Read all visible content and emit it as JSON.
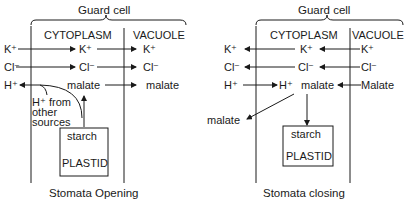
{
  "panels": [
    {
      "caption": "Stomata Opening",
      "header": "Guard cell",
      "col_cytoplasm": "CYTOPLASM",
      "col_vacuole": "VACUOLE",
      "ions_out": [
        "K⁺",
        "Cl⁻",
        "H⁺"
      ],
      "ions_cyto": [
        "K⁺",
        "Cl⁻",
        "malate"
      ],
      "ions_vac": [
        "K⁺",
        "Cl⁻",
        "malate"
      ],
      "hplus_note": [
        "H⁺ from",
        "other",
        "sources"
      ],
      "plastid_top": "starch",
      "plastid_label": "PLASTID"
    },
    {
      "caption": "Stomata closing",
      "header": "Guard cell",
      "col_cytoplasm": "CYTOPLASM",
      "col_vacuole": "VACUOLE",
      "ions_out": [
        "K⁺",
        "Cl⁻",
        "H⁺"
      ],
      "ions_cyto": [
        "K⁺",
        "Cl⁻",
        "H⁺",
        "malate"
      ],
      "ions_vac": [
        "K⁺",
        "Cl⁻",
        "Malate"
      ],
      "malate_out": "malate",
      "plastid_top": "starch",
      "plastid_label": "PLASTID"
    }
  ]
}
